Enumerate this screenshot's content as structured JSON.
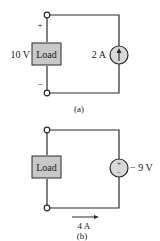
{
  "figure_a": {
    "caption": "(a)",
    "load_label": "Load",
    "load_voltage_label": "10 V",
    "plus_sign": "+",
    "minus_sign": "−",
    "source_type": "current-source",
    "source_label": "2 A",
    "source_arrow_direction": "up"
  },
  "figure_b": {
    "caption": "(b)",
    "load_label": "Load",
    "source_type": "voltage-source",
    "source_label": "− 9 V",
    "source_plus": "+",
    "source_minus": "−",
    "current_label": "4 A",
    "current_arrow_direction": "right"
  },
  "colors": {
    "wire": "#2a2a2a",
    "load_fill": "#c8c8c8",
    "source_fill": "#d8d8d8",
    "terminal_fill": "#ffffff"
  }
}
